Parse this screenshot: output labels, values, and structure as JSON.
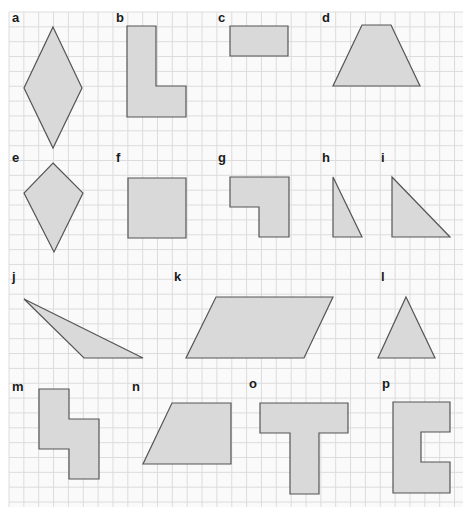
{
  "grid": {
    "x0": 9,
    "y0": 12,
    "x1": 463,
    "y1": 507,
    "cell": 14.85,
    "line_color": "#dcdcdc",
    "background": "#fafafa"
  },
  "colors": {
    "fill": "#d9d9d9",
    "stroke": "#555555",
    "label": "#1a1a1a"
  },
  "shapes": [
    {
      "label": "a",
      "lx": 12,
      "ly": 22,
      "name": "rhombus",
      "points": "53,27 82,88 53,148 24,88"
    },
    {
      "label": "b",
      "lx": 116,
      "ly": 22,
      "name": "l-shape",
      "points": "127,26 156,26 156,86 186,86 186,117 127,117"
    },
    {
      "label": "c",
      "lx": 218,
      "ly": 22,
      "name": "rectangle",
      "points": "230,26 288,26 288,56 230,56"
    },
    {
      "label": "d",
      "lx": 322,
      "ly": 22,
      "name": "trapezoid",
      "points": "362,25 391,25 420,86 333,86"
    },
    {
      "label": "e",
      "lx": 12,
      "ly": 162,
      "name": "kite",
      "points": "53,163 83,193 54,252 24,193"
    },
    {
      "label": "f",
      "lx": 116,
      "ly": 162,
      "name": "square",
      "points": "128,178 186,178 186,238 128,238"
    },
    {
      "label": "g",
      "lx": 218,
      "ly": 162,
      "name": "l-shape",
      "points": "230,177 289,177 289,237 259,237 259,207 230,207"
    },
    {
      "label": "h",
      "lx": 322,
      "ly": 162,
      "name": "right-triangle",
      "points": "333,177 362,237 333,237"
    },
    {
      "label": "i",
      "lx": 381,
      "ly": 162,
      "name": "right-triangle",
      "points": "392,177 450,237 392,237"
    },
    {
      "label": "j",
      "lx": 12,
      "ly": 281,
      "name": "obtuse-triangle",
      "points": "24,299 143,358 84,358"
    },
    {
      "label": "k",
      "lx": 174,
      "ly": 281,
      "name": "parallelogram",
      "points": "216,297 333,297 304,358 186,358"
    },
    {
      "label": "l",
      "lx": 381,
      "ly": 281,
      "name": "triangle",
      "points": "406,297 435,358 378,358"
    },
    {
      "label": "m",
      "lx": 12,
      "ly": 391,
      "name": "s-shape",
      "points": "39,389 69,389 69,419 99,419 99,479 69,479 69,449 39,449"
    },
    {
      "label": "n",
      "lx": 132,
      "ly": 391,
      "name": "trapezoid",
      "points": "172,403 231,403 231,464 143,464"
    },
    {
      "label": "o",
      "lx": 249,
      "ly": 388,
      "name": "t-shape",
      "points": "260,403 348,403 348,433 319,433 319,494 290,494 290,433 260,433"
    },
    {
      "label": "p",
      "lx": 382,
      "ly": 388,
      "name": "c-shape",
      "points": "393,402 450,402 450,432 421,432 421,462 450,462 450,493 393,493"
    }
  ]
}
